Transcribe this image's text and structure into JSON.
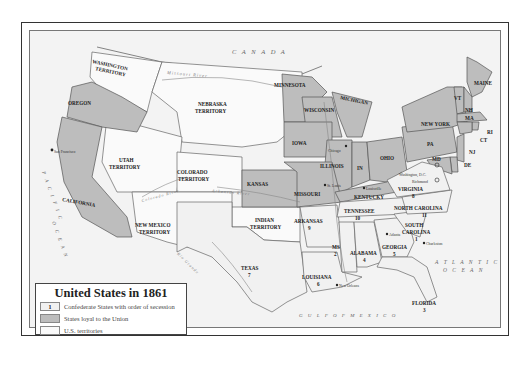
{
  "map": {
    "title": "United States in 1861",
    "colors": {
      "confederate": "#f1f1f1",
      "union": "#bdbdbd",
      "territory": "#fafafa",
      "water": "#f3f3f3",
      "foreign": "#f3f3f3",
      "border": "#555555"
    },
    "legend": {
      "items": [
        {
          "swatch_label": "1",
          "label": "Confederate States with order of secession",
          "category": "confederate"
        },
        {
          "swatch_label": "",
          "label": "States loyal to the Union",
          "category": "union"
        },
        {
          "swatch_label": "",
          "label": "U.S. territories",
          "category": "territory"
        }
      ]
    },
    "regions": {
      "countries": [
        "CANADA",
        "MEXICO"
      ],
      "water_bodies": [
        "PACIFIC OCEAN",
        "ATLANTIC OCEAN",
        "GULF OF MEXICO"
      ],
      "rivers": [
        "Missouri River",
        "Mississippi River",
        "Colorado River",
        "Arkansas River",
        "Rio Grande",
        "Ohio River"
      ]
    },
    "union_states": [
      "OREGON",
      "CALIFORNIA",
      "KANSAS",
      "MINNESOTA",
      "WISCONSIN",
      "MICHIGAN",
      "IOWA",
      "ILLINOIS",
      "IN",
      "OHIO",
      "MISSOURI",
      "KENTUCKY",
      "PA",
      "NEW YORK",
      "MAINE",
      "VT",
      "NH",
      "MA",
      "RI",
      "CT",
      "NJ",
      "DE",
      "MD"
    ],
    "confederate_states": [
      {
        "name": "SOUTH CAROLINA",
        "order": "1"
      },
      {
        "name": "MS",
        "order": "2"
      },
      {
        "name": "FLORIDA",
        "order": "3"
      },
      {
        "name": "ALABAMA",
        "order": "4"
      },
      {
        "name": "GEORGIA",
        "order": "5"
      },
      {
        "name": "LOUISIANA",
        "order": "6"
      },
      {
        "name": "TEXAS",
        "order": "7"
      },
      {
        "name": "VIRGINIA",
        "order": "8"
      },
      {
        "name": "ARKANSAS",
        "order": "9"
      },
      {
        "name": "TENNESSEE",
        "order": "10"
      },
      {
        "name": "NORTH CAROLINA",
        "order": "11"
      }
    ],
    "territories": [
      "WASHINGTON TERRITORY",
      "NEBRASKA TERRITORY",
      "UTAH TERRITORY",
      "COLORADO TERRITORY",
      "NEW MEXICO TERRITORY",
      "INDIAN TERRITORY"
    ],
    "cities": [
      "San Francisco",
      "Chicago",
      "St. Louis",
      "Louisville",
      "Washington, D.C.",
      "Richmond",
      "Atlanta",
      "Charleston",
      "New Orleans"
    ],
    "labels": {
      "canada": "C A N A D A",
      "mexico": "M E X I C O",
      "pacific1": "P A C I F I C",
      "pacific2": "O C E A N",
      "atlantic1": "A T L A N T I C",
      "atlantic2": "O C E A N",
      "gulf": "G U L F   O F   M E X I C O",
      "missouri_river": "Missouri River",
      "colorado_river": "Colorado River",
      "arkansas_river": "Arkansas River",
      "rio_grande": "Rio Grande",
      "mississippi_river": "Mississippi River",
      "washington1": "WASHINGTON",
      "washington2": "TERRITORY",
      "oregon": "OREGON",
      "california": "CALIFORNIA",
      "nebraska1": "NEBRASKA",
      "nebraska2": "TERRITORY",
      "utah1": "UTAH",
      "utah2": "TERRITORY",
      "colorado1": "COLORADO",
      "colorado2": "TERRITORY",
      "newmexico1": "NEW MEXICO",
      "newmexico2": "TERRITORY",
      "indian1": "INDIAN",
      "indian2": "TERRITORY",
      "kansas": "KANSAS",
      "minnesota": "MINNESOTA",
      "wisconsin": "WISCONSIN",
      "michigan": "MICHIGAN",
      "iowa": "IOWA",
      "illinois": "ILLINOIS",
      "indiana": "IN",
      "ohio": "OHIO",
      "missouri": "MISSOURI",
      "kentucky": "KENTUCKY",
      "pa": "PA",
      "newyork": "NEW YORK",
      "maine": "MAINE",
      "vt": "VT",
      "nh": "NH",
      "ma": "MA",
      "ri": "RI",
      "ct": "CT",
      "nj": "NJ",
      "de": "DE",
      "md": "MD",
      "texas": "TEXAS",
      "texas_n": "7",
      "arkansas": "ARKANSAS",
      "arkansas_n": "9",
      "louisiana": "LOUISIANA",
      "louisiana_n": "6",
      "ms": "MS",
      "ms_n": "2",
      "alabama": "ALABAMA",
      "alabama_n": "4",
      "georgia": "GEORGIA",
      "georgia_n": "5",
      "florida": "FLORIDA",
      "florida_n": "3",
      "tennessee": "TENNESSEE",
      "tennessee_n": "10",
      "sc1": "SOUTH",
      "sc2": "CAROLINA",
      "sc_n": "1",
      "nc": "NORTH CAROLINA",
      "nc_n": "11",
      "virginia": "VIRGINIA",
      "virginia_n": "8",
      "sanfrancisco": "San Francisco",
      "chicago": "Chicago",
      "stlouis": "St. Louis",
      "louisville": "Louisville",
      "washingtondc": "Washington, D.C.",
      "richmond": "Richmond",
      "atlanta": "Atlanta",
      "charleston": "Charleston",
      "neworleans": "New Orleans"
    }
  }
}
